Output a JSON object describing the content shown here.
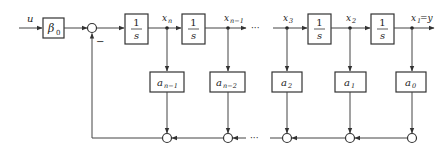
{
  "diagram": {
    "type": "block-diagram",
    "input_label": "u",
    "input_gain": {
      "symbol": "β",
      "sub": "0"
    },
    "feedback_sign": "−",
    "integrator": {
      "num": "1",
      "den": "s"
    },
    "states": [
      {
        "name": "x",
        "sub": "n"
      },
      {
        "name": "x",
        "sub": "n−1"
      },
      {
        "name": "x",
        "sub": "3"
      },
      {
        "name": "x",
        "sub": "2"
      },
      {
        "name": "x",
        "sub": "1",
        "suffix": "=y"
      }
    ],
    "gains": [
      {
        "name": "a",
        "sub": "n−1"
      },
      {
        "name": "a",
        "sub": "n−2"
      },
      {
        "name": "a",
        "sub": "2"
      },
      {
        "name": "a",
        "sub": "1"
      },
      {
        "name": "a",
        "sub": "0"
      }
    ],
    "ellipsis": "···",
    "colors": {
      "line": "#444444",
      "box": "#333333",
      "background": "#ffffff"
    }
  }
}
